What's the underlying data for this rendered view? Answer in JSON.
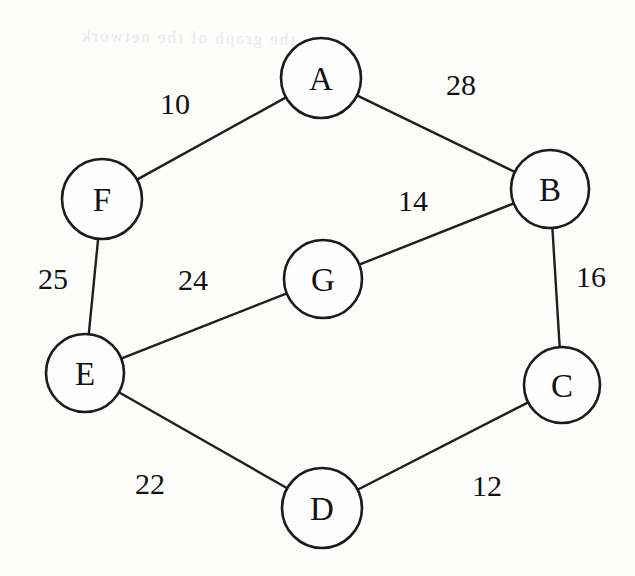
{
  "figure": {
    "kind": "weighted-undirected-graph",
    "width": 635,
    "height": 576,
    "background_color": "#fdfdfc",
    "ink_color": "#1b1b1b",
    "node_radius": 39,
    "node_fill": "#fefefe"
  },
  "nodes": [
    {
      "id": "A",
      "label": "A",
      "cx": 321,
      "cy": 78,
      "r": 40
    },
    {
      "id": "B",
      "label": "B",
      "cx": 550,
      "cy": 189,
      "r": 39
    },
    {
      "id": "C",
      "label": "C",
      "cx": 562,
      "cy": 385,
      "r": 38
    },
    {
      "id": "D",
      "label": "D",
      "cx": 322,
      "cy": 508,
      "r": 40
    },
    {
      "id": "E",
      "label": "E",
      "cx": 85,
      "cy": 373,
      "r": 39
    },
    {
      "id": "F",
      "label": "F",
      "cx": 102,
      "cy": 199,
      "r": 40
    },
    {
      "id": "G",
      "label": "G",
      "cx": 323,
      "cy": 279,
      "r": 39
    }
  ],
  "edges": [
    {
      "id": "AF",
      "from": "A",
      "to": "F",
      "weight": "10",
      "label_x": 175,
      "label_y": 103
    },
    {
      "id": "AB",
      "from": "A",
      "to": "B",
      "weight": "28",
      "label_x": 461,
      "label_y": 84
    },
    {
      "id": "BG",
      "from": "B",
      "to": "G",
      "weight": "14",
      "label_x": 413,
      "label_y": 200
    },
    {
      "id": "BC",
      "from": "B",
      "to": "C",
      "weight": "16",
      "label_x": 591,
      "label_y": 276
    },
    {
      "id": "CD",
      "from": "C",
      "to": "D",
      "weight": "12",
      "label_x": 487,
      "label_y": 485
    },
    {
      "id": "DE",
      "from": "D",
      "to": "E",
      "weight": "22",
      "label_x": 150,
      "label_y": 483
    },
    {
      "id": "EG",
      "from": "E",
      "to": "G",
      "weight": "24",
      "label_x": 193,
      "label_y": 279
    },
    {
      "id": "EF",
      "from": "E",
      "to": "F",
      "weight": "25",
      "label_x": 53,
      "label_y": 278
    }
  ],
  "artifact": {
    "text": "the graph of the network",
    "x": 80,
    "y": 28,
    "color": "#e9e9ea"
  }
}
